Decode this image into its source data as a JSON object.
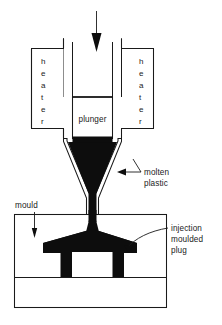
{
  "figure": {
    "background_color": "#ffffff",
    "line_color": "#1a1a1a",
    "plastic_color": "#0d0d0d"
  },
  "labels": {
    "heater_left": "heater",
    "heater_right": "heater",
    "plunger": "plunger",
    "molten_plastic_line1": "molten",
    "molten_plastic_line2": "plastic",
    "mould": "mould",
    "plug_line1": "injection",
    "plug_line2": "moulded",
    "plug_line3": "plug"
  },
  "letters": {
    "heater_stack": [
      "h",
      "e",
      "a",
      "t",
      "e",
      "r"
    ]
  },
  "annotations": {
    "force_arrow": "downward-arrow-into-plunger",
    "mould_arrow": "downward-arrow-to-mould",
    "molten_arrow": "left-pointing-arrow-to-nozzle",
    "plug_arrow": "curved-leader-to-moulded-plug"
  }
}
